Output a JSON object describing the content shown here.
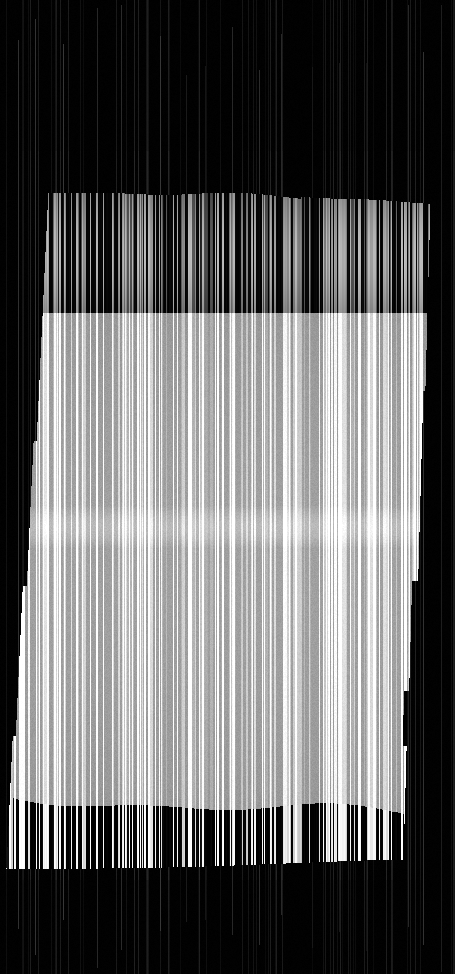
{
  "image": {
    "title": "Slit-scan vertical stripe composition",
    "width": 455,
    "height": 974,
    "background_color": "#000000",
    "description": "Abstract slit-scan / motion-smear photograph rendered as dense vertical stripes of varying grayscale forming a slightly skewed quadrilateral region on a black field."
  },
  "chart_data": {
    "type": "heatmap",
    "title": "Slit-scan vertical stripe composition",
    "xlabel": "",
    "ylabel": "",
    "x": [
      0,
      455
    ],
    "ylim": [
      0,
      974
    ],
    "grid": false,
    "legend": "none",
    "colormap": "grayscale"
  },
  "bands": [
    {
      "name": "top-black-field",
      "label": "Upper black field with faint vertical seam lines",
      "y_start": 0,
      "y_end": 188,
      "base_color": "#000000",
      "stripe_brightness_min": 0,
      "stripe_brightness_max": 42,
      "character": "near-black with sparse faint gray 1px seams"
    },
    {
      "name": "upper-dark-striped-band",
      "label": "Upper dark-striped band",
      "y_start": 188,
      "y_end": 313,
      "base_color": "#8a8a8a",
      "stripe_brightness_min": 6,
      "stripe_brightness_max": 176,
      "character": "high contrast mid-gray stripes interleaved with black bars; top edge slopes from y=188 at left to y=203 at right"
    },
    {
      "name": "main-light-band",
      "label": "Main light gray band with white streaks",
      "y_start": 313,
      "y_end": 795,
      "base_color": "#b9b9b9",
      "stripe_brightness_min": 138,
      "stripe_brightness_max": 255,
      "character": "light gray field threaded with pure-white vertical streaks"
    },
    {
      "name": "mid-highlight-band",
      "label": "Subtle horizontal highlight band",
      "y_start": 505,
      "y_end": 548,
      "base_color": "#d2d2d2",
      "stripe_brightness_min": 160,
      "stripe_brightness_max": 255,
      "character": "slightly brighter horizontal exposure band across the main light band"
    },
    {
      "name": "lower-contrast-band",
      "label": "Lower high-contrast black and white band",
      "y_start": 795,
      "y_end": 868,
      "base_color": "#101010",
      "stripe_brightness_min": 0,
      "stripe_brightness_max": 255,
      "character": "hard black bars alternating with bright white bars; top edge wavy, descending left to right"
    },
    {
      "name": "bottom-black-field",
      "label": "Lower black field with faint vertical seam lines",
      "y_start": 868,
      "y_end": 974,
      "base_color": "#000000",
      "stripe_brightness_min": 0,
      "stripe_brightness_max": 38,
      "character": "near-black with sparse faint gray 1px seams"
    }
  ],
  "region": {
    "label": "Content quadrilateral",
    "left_edge_x_top": 48,
    "left_edge_x_bottom": 16,
    "right_edge_x_top": 430,
    "right_edge_x_bottom": 412,
    "top_edge_y_left": 188,
    "top_edge_y_right": 203,
    "bottom_edge_y_left": 868,
    "bottom_edge_y_right": 860,
    "edge_steps": "Left and right boundaries are stepped rather than smooth, with jumps at roughly y=440, y=585, y=735 on the left and y=390, y=580, y=690, y=745 on the right."
  },
  "palette": {
    "black": "#000000",
    "near_black": "#050505",
    "dark_gray": "#2b2b2b",
    "mid_gray": "#8a8a8a",
    "light_gray": "#b9b9b9",
    "pale_gray": "#d2d2d2",
    "white": "#ffffff"
  }
}
